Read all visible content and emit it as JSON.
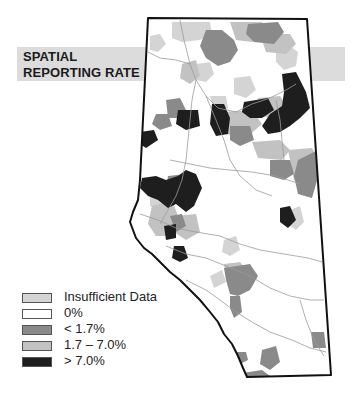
{
  "title": {
    "line1": "SPATIAL",
    "line2": "REPORTING RATE"
  },
  "colors": {
    "insufficient": "#d4d4d4",
    "zero": "#ffffff",
    "low": "#8a8a8a",
    "mid": "#c2c2c2",
    "high": "#1e1e1e",
    "border": "#111111",
    "river": "#9a9a9a",
    "band": "#dcdcdc"
  },
  "legend": {
    "items": [
      {
        "label": "Insufficient Data",
        "category": "insufficient",
        "color": "#d4d4d4"
      },
      {
        "label": "0%",
        "category": "zero",
        "color": "#ffffff"
      },
      {
        "label": "< 1.7%",
        "category": "low",
        "color": "#8a8a8a"
      },
      {
        "label": "1.7 – 7.0%",
        "category": "mid",
        "color": "#c2c2c2"
      },
      {
        "label": "> 7.0%",
        "category": "high",
        "color": "#1e1e1e"
      }
    ]
  },
  "map": {
    "outline": "148,18 307,19 331,375 247,377 243,368 238,356 232,344 224,334 218,322 210,312 200,300 190,290 180,280 170,272 160,262 152,254 144,248 136,238 130,222 133,212 138,200 140,180",
    "regions": [
      {
        "category": "insufficient",
        "points": "172,22 210,22 212,34 200,40 182,42 172,38"
      },
      {
        "category": "insufficient",
        "points": "150,36 160,34 166,44 158,52 150,50"
      },
      {
        "category": "insufficient",
        "points": "276,50 290,46 298,52 296,66 284,70 276,62"
      },
      {
        "category": "insufficient",
        "points": "196,64 210,62 214,74 206,82 196,80"
      },
      {
        "category": "insufficient",
        "points": "234,78 250,76 256,90 246,98 234,94"
      },
      {
        "category": "insufficient",
        "points": "210,96 226,96 228,108 214,112"
      },
      {
        "category": "insufficient",
        "points": "150,182 166,186 170,200 160,212 150,206"
      },
      {
        "category": "insufficient",
        "points": "224,240 236,236 240,250 230,256 222,252"
      },
      {
        "category": "insufficient",
        "points": "290,210 300,206 304,222 296,230 288,224"
      },
      {
        "category": "insufficient",
        "points": "210,276 222,270 226,282 214,288"
      },
      {
        "category": "mid",
        "points": "230,22 262,22 266,36 252,42 236,40"
      },
      {
        "category": "mid",
        "points": "260,34 290,34 296,44 286,54 266,52"
      },
      {
        "category": "mid",
        "points": "182,64 196,60 200,76 190,84 180,78"
      },
      {
        "category": "mid",
        "points": "222,112 252,110 262,124 246,138 226,134"
      },
      {
        "category": "mid",
        "points": "252,142 280,140 290,150 282,160 258,158"
      },
      {
        "category": "mid",
        "points": "288,150 312,148 320,162 310,188 294,180"
      },
      {
        "category": "mid",
        "points": "152,206 172,200 178,216 170,236 156,236 148,224"
      },
      {
        "category": "mid",
        "points": "176,216 196,214 200,232 186,240 174,232"
      },
      {
        "category": "mid",
        "points": "224,264 240,262 248,272 240,282 226,278"
      },
      {
        "category": "mid",
        "points": "258,98 280,96 288,108 276,118 258,116"
      },
      {
        "category": "low",
        "points": "206,30 222,30 234,40 238,50 230,62 218,66 206,58 200,46"
      },
      {
        "category": "low",
        "points": "248,24 278,22 284,32 274,44 254,42 246,34"
      },
      {
        "category": "low",
        "points": "166,100 180,98 186,110 180,118 168,118"
      },
      {
        "category": "low",
        "points": "156,114 168,114 172,126 160,130 152,124"
      },
      {
        "category": "low",
        "points": "230,126 250,126 254,140 240,146 230,140"
      },
      {
        "category": "low",
        "points": "270,160 290,160 294,174 284,180 270,176"
      },
      {
        "category": "low",
        "points": "298,160 318,150 320,170 312,198 298,194 294,176"
      },
      {
        "category": "low",
        "points": "168,176 186,174 190,186 176,192 166,188"
      },
      {
        "category": "low",
        "points": "170,216 182,214 186,226 176,232"
      },
      {
        "category": "low",
        "points": "224,268 250,264 258,276 250,290 238,296 230,294 226,280"
      },
      {
        "category": "low",
        "points": "230,296 240,296 242,312 234,318 230,308"
      },
      {
        "category": "low",
        "points": "311,332 324,332 326,348 313,348"
      },
      {
        "category": "low",
        "points": "262,350 276,346 280,362 270,370 260,364"
      },
      {
        "category": "low",
        "points": "234,352 246,352 248,360 240,364"
      },
      {
        "category": "low",
        "points": "236,374 262,370 270,376 250,378"
      },
      {
        "category": "high",
        "points": "282,74 296,72 300,80 306,92 310,108 300,118 290,126 280,132 268,134 262,126 270,114 282,106 284,92"
      },
      {
        "category": "high",
        "points": "244,102 268,98 274,110 262,118 250,118 242,112"
      },
      {
        "category": "high",
        "points": "212,104 224,104 230,118 228,134 216,136 210,124"
      },
      {
        "category": "high",
        "points": "178,110 198,110 200,126 186,130 176,124"
      },
      {
        "category": "high",
        "points": "140,132 154,130 158,140 146,148 140,144"
      },
      {
        "category": "high",
        "points": "178,176 186,170 196,174 202,188 194,206 186,212 176,204 168,208 158,200 148,196 140,188 142,178 156,176 166,180"
      },
      {
        "category": "high",
        "points": "280,208 290,206 296,220 288,228 280,222"
      },
      {
        "category": "high",
        "points": "164,226 176,224 176,238 166,240"
      },
      {
        "category": "high",
        "points": "174,246 184,246 188,258 180,262 172,258"
      }
    ],
    "rivers": [
      "180,20 184,40 190,64 196,80 206,96 218,108 236,112 252,104 270,98 286,90 296,84",
      "148,52 160,58 176,60 190,64",
      "196,80 192,100 190,120 188,140 186,160 182,180 176,196 168,210 160,224",
      "206,96 216,120 224,140 230,160 240,176 256,190 272,196",
      "140,214 158,220 176,228 196,232 220,236 240,244 260,250 284,254 308,258 322,262",
      "166,246 186,254 206,258 226,266 250,276 270,288 290,296 310,300 324,300",
      "186,280 206,290 220,300 236,312 252,322 270,332 292,340 310,348 326,352",
      "170,160 190,164 210,168 230,170 252,172 276,176 300,184",
      "276,100 280,120 282,140 284,160",
      "300,300 306,320 314,340 324,356"
    ]
  }
}
